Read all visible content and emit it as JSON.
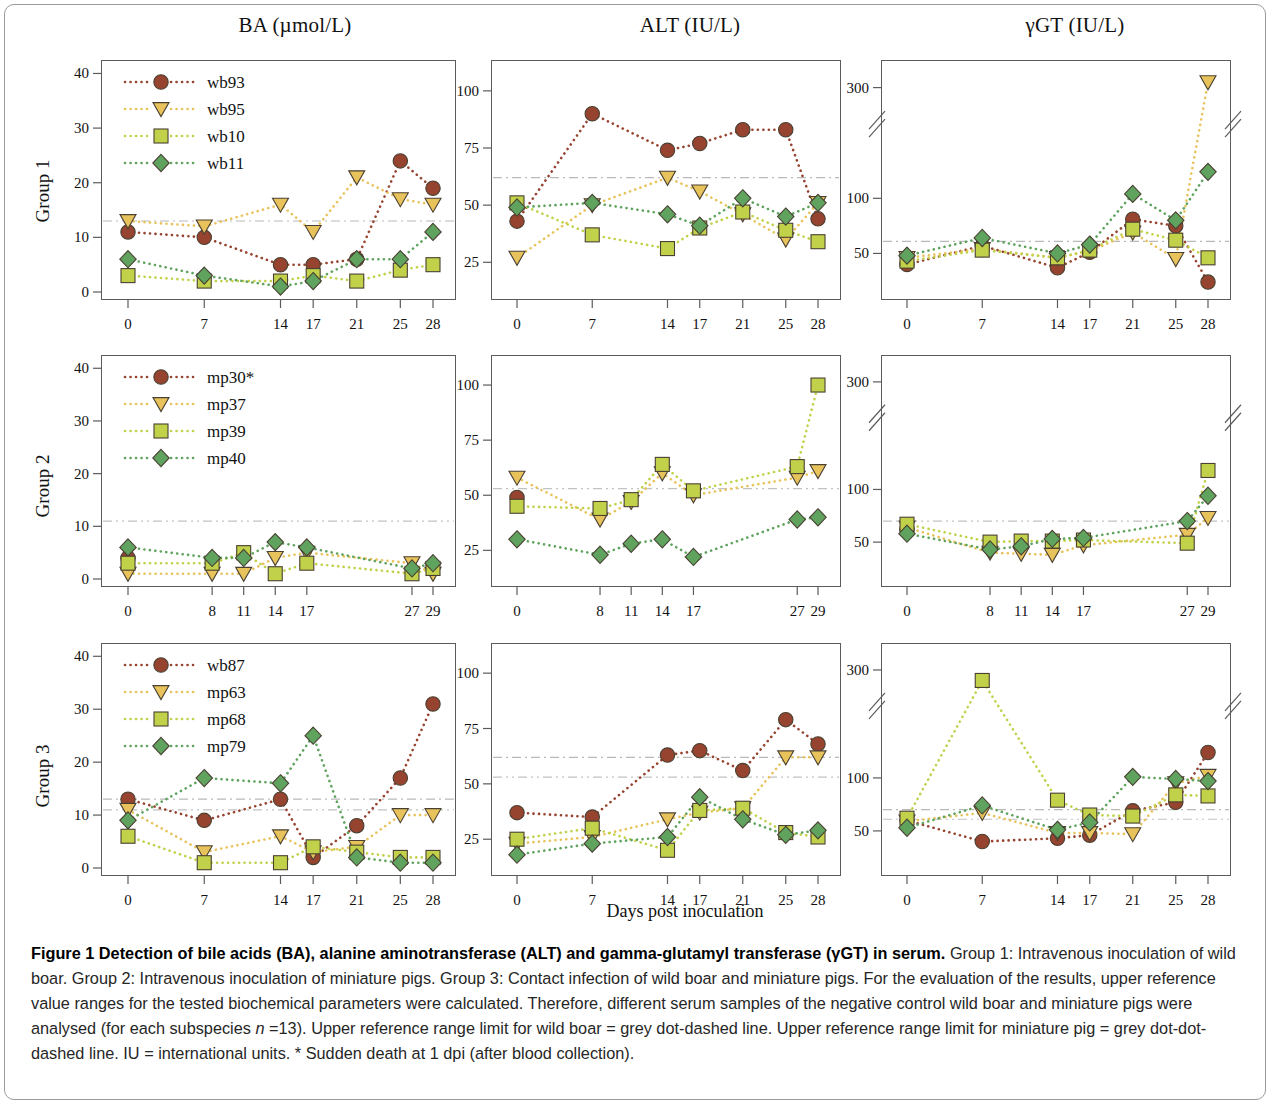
{
  "figure": {
    "column_titles": [
      "BA (µmol/L)",
      "ALT (IU/L)",
      "γGT (IU/L)"
    ],
    "row_labels": [
      "Group 1",
      "Group 2",
      "Group 3"
    ],
    "xlabel": "Days post inoculation"
  },
  "caption": {
    "bold_lead": "Figure 1 Detection of bile acids (BA), alanine aminotransferase (ALT) and gamma-glutamyl transferase (γGT) in serum.",
    "body_1": " Group 1: Intravenous inoculation of wild boar. Group 2: Intravenous inoculation of miniature pigs. Group 3: Contact infection of wild boar and miniature pigs. For the evaluation of the results, upper reference value ranges for the tested biochemical parameters were calculated. Therefore, different serum samples of the negative control wild boar and miniature pigs were analysed (for each subspecies ",
    "italic_n": "n",
    "body_2": " =13). Upper reference range limit for wild boar = grey dot-dashed line. Upper reference range limit for miniature pig = grey dot-dot-dashed line. IU = international units. * Sudden death at 1 dpi (after blood collection)."
  },
  "colors": {
    "circle": "#96432f",
    "triangle": "#e8c35c",
    "square": "#c2d14a",
    "diamond": "#5fa35f",
    "refline_wildboar": "#b9b9b9",
    "refline_minipig": "#c2c2c2",
    "axis": "#5b5b5b"
  },
  "chart_data": [
    {
      "id": "g1-ba",
      "type": "line",
      "title": "BA (µmol/L)",
      "row": "Group 1",
      "xlabel": "Days post inoculation",
      "ylabel": "BA (µmol/L)",
      "x": [
        0,
        7,
        14,
        17,
        21,
        25,
        28
      ],
      "xticks": [
        "0",
        "7",
        "14",
        "17",
        "21",
        "25",
        "28"
      ],
      "yticks": [
        0,
        10,
        20,
        30,
        40
      ],
      "ylim": [
        0,
        41
      ],
      "grid": false,
      "legend_position": "top-left",
      "reference_lines": [
        {
          "label": "wild boar upper reference",
          "value": 13,
          "style": "dot-dashed"
        }
      ],
      "series": [
        {
          "name": "wb93",
          "marker": "circle",
          "values": [
            11,
            10,
            5,
            5,
            6,
            24,
            19
          ]
        },
        {
          "name": "wb95",
          "marker": "triangle",
          "values": [
            13,
            12,
            16,
            11,
            21,
            17,
            16
          ]
        },
        {
          "name": "wb10",
          "marker": "square",
          "values": [
            3,
            2,
            2,
            3,
            2,
            4,
            5
          ]
        },
        {
          "name": "wb11",
          "marker": "diamond",
          "values": [
            6,
            3,
            1,
            2,
            6,
            6,
            11
          ]
        }
      ]
    },
    {
      "id": "g1-alt",
      "type": "line",
      "title": "ALT (IU/L)",
      "row": "Group 1",
      "xlabel": "Days post inoculation",
      "ylabel": "ALT (IU/L)",
      "x": [
        0,
        7,
        14,
        17,
        21,
        25,
        28
      ],
      "xticks": [
        "0",
        "7",
        "14",
        "17",
        "21",
        "25",
        "28"
      ],
      "yticks": [
        25,
        50,
        75,
        100
      ],
      "ylim": [
        12,
        110
      ],
      "grid": false,
      "legend_position": "none",
      "reference_lines": [
        {
          "label": "wild boar upper reference",
          "value": 62,
          "style": "dot-dashed"
        }
      ],
      "series": [
        {
          "name": "wb93",
          "marker": "circle",
          "values": [
            43,
            90,
            74,
            77,
            83,
            83,
            44
          ]
        },
        {
          "name": "wb95",
          "marker": "triangle",
          "values": [
            27,
            50,
            62,
            56,
            46,
            35,
            51
          ]
        },
        {
          "name": "wb10",
          "marker": "square",
          "values": [
            51,
            37,
            31,
            40,
            47,
            39,
            34
          ]
        },
        {
          "name": "wb11",
          "marker": "diamond",
          "values": [
            49,
            51,
            46,
            41,
            53,
            45,
            51
          ]
        }
      ]
    },
    {
      "id": "g1-ggt",
      "type": "line",
      "title": "γGT (IU/L)",
      "row": "Group 1",
      "xlabel": "Days post inoculation",
      "ylabel": "γGT (IU/L)",
      "x": [
        0,
        7,
        14,
        17,
        21,
        25,
        28
      ],
      "xticks": [
        "0",
        "7",
        "14",
        "17",
        "21",
        "25",
        "28"
      ],
      "yticks": [
        50,
        100,
        300
      ],
      "ylim": [
        15,
        320
      ],
      "axis_break": {
        "from": 150,
        "to": 280
      },
      "grid": false,
      "legend_position": "none",
      "reference_lines": [
        {
          "label": "wild boar upper reference",
          "value": 61,
          "style": "dot-dashed"
        }
      ],
      "series": [
        {
          "name": "wb93",
          "marker": "circle",
          "values": [
            40,
            57,
            37,
            51,
            81,
            75,
            24
          ]
        },
        {
          "name": "wb95",
          "marker": "triangle",
          "values": [
            46,
            54,
            46,
            52,
            69,
            45,
            305
          ]
        },
        {
          "name": "wb10",
          "marker": "square",
          "values": [
            43,
            53,
            46,
            53,
            72,
            62,
            46
          ]
        },
        {
          "name": "wb11",
          "marker": "diamond",
          "values": [
            48,
            64,
            50,
            58,
            104,
            80,
            124
          ]
        }
      ]
    },
    {
      "id": "g2-ba",
      "type": "line",
      "title": "BA (µmol/L)",
      "row": "Group 2",
      "xlabel": "Days post inoculation",
      "ylabel": "BA (µmol/L)",
      "x": [
        0,
        8,
        11,
        14,
        17,
        27,
        29
      ],
      "xticks": [
        "0",
        "8",
        "11",
        "14",
        "17",
        "27",
        "29"
      ],
      "yticks": [
        0,
        10,
        20,
        30,
        40
      ],
      "ylim": [
        0,
        41
      ],
      "grid": false,
      "legend_position": "top-left",
      "reference_lines": [
        {
          "label": "miniature pig upper reference",
          "value": 11,
          "style": "dot-dot-dashed"
        }
      ],
      "series": [
        {
          "name": "mp30*",
          "marker": "circle",
          "values": [
            4,
            null,
            null,
            null,
            null,
            null,
            null
          ]
        },
        {
          "name": "mp37",
          "marker": "triangle",
          "values": [
            1,
            1,
            1,
            4,
            5,
            3,
            1
          ]
        },
        {
          "name": "mp39",
          "marker": "square",
          "values": [
            3,
            3,
            5,
            1,
            3,
            1,
            2
          ]
        },
        {
          "name": "mp40",
          "marker": "diamond",
          "values": [
            6,
            4,
            4,
            7,
            6,
            2,
            3
          ]
        }
      ]
    },
    {
      "id": "g2-alt",
      "type": "line",
      "title": "ALT (IU/L)",
      "row": "Group 2",
      "xlabel": "Days post inoculation",
      "ylabel": "ALT (IU/L)",
      "x": [
        0,
        8,
        11,
        14,
        17,
        27,
        29
      ],
      "xticks": [
        "0",
        "8",
        "11",
        "14",
        "17",
        "27",
        "29"
      ],
      "yticks": [
        25,
        50,
        75,
        100
      ],
      "ylim": [
        12,
        110
      ],
      "grid": false,
      "legend_position": "none",
      "reference_lines": [
        {
          "label": "miniature pig upper reference",
          "value": 53,
          "style": "dot-dot-dashed"
        }
      ],
      "series": [
        {
          "name": "mp30*",
          "marker": "circle",
          "values": [
            49,
            null,
            null,
            null,
            null,
            null,
            null
          ]
        },
        {
          "name": "mp37",
          "marker": "triangle",
          "values": [
            58,
            39,
            47,
            60,
            50,
            58,
            61
          ]
        },
        {
          "name": "mp39",
          "marker": "square",
          "values": [
            45,
            44,
            48,
            64,
            52,
            63,
            100
          ]
        },
        {
          "name": "mp40",
          "marker": "diamond",
          "values": [
            30,
            23,
            28,
            30,
            22,
            39,
            40
          ]
        }
      ]
    },
    {
      "id": "g2-ggt",
      "type": "line",
      "title": "γGT (IU/L)",
      "row": "Group 2",
      "xlabel": "Days post inoculation",
      "ylabel": "γGT (IU/L)",
      "x": [
        0,
        8,
        11,
        14,
        17,
        27,
        29
      ],
      "xticks": [
        "0",
        "8",
        "11",
        "14",
        "17",
        "27",
        "29"
      ],
      "yticks": [
        50,
        100,
        300
      ],
      "ylim": [
        15,
        320
      ],
      "axis_break": {
        "from": 150,
        "to": 280
      },
      "grid": false,
      "legend_position": "none",
      "reference_lines": [
        {
          "label": "miniature pig upper reference",
          "value": 70,
          "style": "dot-dot-dashed"
        }
      ],
      "series": [
        {
          "name": "mp30*",
          "marker": "circle",
          "values": [
            62,
            null,
            null,
            null,
            null,
            null,
            null
          ]
        },
        {
          "name": "mp37",
          "marker": "triangle",
          "values": [
            64,
            40,
            39,
            38,
            47,
            57,
            73
          ]
        },
        {
          "name": "mp39",
          "marker": "square",
          "values": [
            67,
            50,
            51,
            51,
            52,
            49,
            118
          ]
        },
        {
          "name": "mp40",
          "marker": "diamond",
          "values": [
            58,
            43,
            46,
            53,
            54,
            70,
            94
          ]
        }
      ]
    },
    {
      "id": "g3-ba",
      "type": "line",
      "title": "BA (µmol/L)",
      "row": "Group 3",
      "xlabel": "Days post inoculation",
      "ylabel": "BA (µmol/L)",
      "x": [
        0,
        7,
        14,
        17,
        21,
        25,
        28
      ],
      "xticks": [
        "0",
        "7",
        "14",
        "17",
        "21",
        "25",
        "28"
      ],
      "yticks": [
        0,
        10,
        20,
        30,
        40
      ],
      "ylim": [
        0,
        41
      ],
      "grid": false,
      "legend_position": "top-left",
      "reference_lines": [
        {
          "label": "wild boar upper reference",
          "value": 13,
          "style": "dot-dashed"
        },
        {
          "label": "miniature pig upper reference",
          "value": 11,
          "style": "dot-dot-dashed"
        }
      ],
      "series": [
        {
          "name": "wb87",
          "marker": "circle",
          "values": [
            13,
            9,
            13,
            2,
            8,
            17,
            31
          ]
        },
        {
          "name": "mp63",
          "marker": "triangle",
          "values": [
            11,
            3,
            6,
            3,
            4,
            10,
            10
          ]
        },
        {
          "name": "mp68",
          "marker": "square",
          "values": [
            6,
            1,
            1,
            4,
            3,
            2,
            2
          ]
        },
        {
          "name": "mp79",
          "marker": "diamond",
          "values": [
            9,
            17,
            16,
            25,
            2,
            1,
            1
          ]
        }
      ]
    },
    {
      "id": "g3-alt",
      "type": "line",
      "title": "ALT (IU/L)",
      "row": "Group 3",
      "xlabel": "Days post inoculation",
      "ylabel": "ALT (IU/L)",
      "x": [
        0,
        7,
        14,
        17,
        21,
        25,
        28
      ],
      "xticks": [
        "0",
        "7",
        "14",
        "17",
        "21",
        "25",
        "28"
      ],
      "yticks": [
        25,
        50,
        75,
        100
      ],
      "ylim": [
        12,
        110
      ],
      "grid": false,
      "legend_position": "none",
      "reference_lines": [
        {
          "label": "wild boar upper reference",
          "value": 62,
          "style": "dot-dashed"
        },
        {
          "label": "miniature pig upper reference",
          "value": 53,
          "style": "dot-dot-dashed"
        }
      ],
      "series": [
        {
          "name": "wb87",
          "marker": "circle",
          "values": [
            37,
            35,
            63,
            65,
            56,
            79,
            68
          ]
        },
        {
          "name": "mp63",
          "marker": "triangle",
          "values": [
            23,
            26,
            34,
            37,
            39,
            62,
            62
          ]
        },
        {
          "name": "mp68",
          "marker": "square",
          "values": [
            25,
            30,
            20,
            38,
            39,
            28,
            26
          ]
        },
        {
          "name": "mp79",
          "marker": "diamond",
          "values": [
            18,
            23,
            26,
            44,
            34,
            27,
            29
          ]
        }
      ]
    },
    {
      "id": "g3-ggt",
      "type": "line",
      "title": "γGT (IU/L)",
      "row": "Group 3",
      "xlabel": "Days post inoculation",
      "ylabel": "γGT (IU/L)",
      "x": [
        0,
        7,
        14,
        17,
        21,
        25,
        28
      ],
      "xticks": [
        "0",
        "7",
        "14",
        "17",
        "21",
        "25",
        "28"
      ],
      "yticks": [
        50,
        100,
        300
      ],
      "ylim": [
        15,
        320
      ],
      "axis_break": {
        "from": 150,
        "to": 280
      },
      "grid": false,
      "legend_position": "none",
      "reference_lines": [
        {
          "label": "wild boar upper reference",
          "value": 70,
          "style": "dot-dashed"
        },
        {
          "label": "miniature pig upper reference",
          "value": 61,
          "style": "dot-dot-dashed"
        }
      ],
      "series": [
        {
          "name": "wb87",
          "marker": "circle",
          "values": [
            60,
            40,
            43,
            46,
            69,
            77,
            124
          ]
        },
        {
          "name": "mp63",
          "marker": "triangle",
          "values": [
            59,
            67,
            48,
            48,
            47,
            95,
            102
          ]
        },
        {
          "name": "mp68",
          "marker": "square",
          "values": [
            62,
            290,
            79,
            65,
            64,
            84,
            83
          ]
        },
        {
          "name": "mp79",
          "marker": "diamond",
          "values": [
            53,
            74,
            51,
            58,
            101,
            99,
            97
          ]
        }
      ]
    }
  ],
  "legends": [
    {
      "panel": "g1-ba",
      "items": [
        {
          "label": "wb93",
          "marker": "circle"
        },
        {
          "label": "wb95",
          "marker": "triangle"
        },
        {
          "label": "wb10",
          "marker": "square"
        },
        {
          "label": "wb11",
          "marker": "diamond"
        }
      ]
    },
    {
      "panel": "g2-ba",
      "items": [
        {
          "label": "mp30*",
          "marker": "circle"
        },
        {
          "label": "mp37",
          "marker": "triangle"
        },
        {
          "label": "mp39",
          "marker": "square"
        },
        {
          "label": "mp40",
          "marker": "diamond"
        }
      ]
    },
    {
      "panel": "g3-ba",
      "items": [
        {
          "label": "wb87",
          "marker": "circle"
        },
        {
          "label": "mp63",
          "marker": "triangle"
        },
        {
          "label": "mp68",
          "marker": "square"
        },
        {
          "label": "mp79",
          "marker": "diamond"
        }
      ]
    }
  ]
}
